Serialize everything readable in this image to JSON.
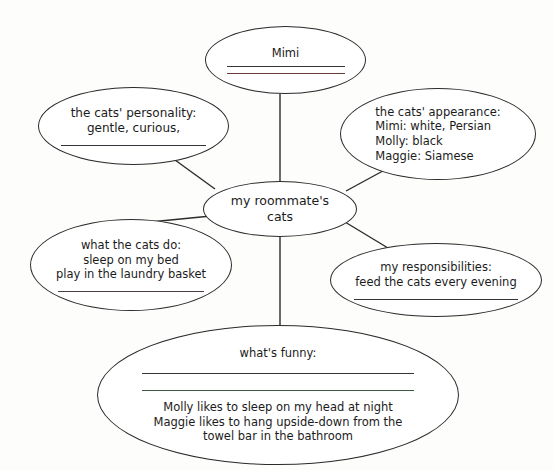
{
  "diagram": {
    "type": "cluster-web-organizer",
    "center": {
      "name": "center-topic",
      "lines": [
        "my roommate's",
        "cats"
      ]
    },
    "nodes": [
      {
        "name": "mimi",
        "lines": [
          "Mimi"
        ],
        "rules": [
          "dark",
          "red"
        ]
      },
      {
        "name": "personality",
        "lines": [
          "the cats' personality:",
          "gentle, curious,"
        ],
        "rules": [
          "dark"
        ]
      },
      {
        "name": "appearance",
        "lines": [
          "the cats' appearance:",
          "Mimi:  white, Persian",
          "Molly:  black",
          "Maggie:  Siamese"
        ],
        "rules": []
      },
      {
        "name": "what-the-cats-do",
        "lines": [
          "what the cats do:",
          "sleep on my bed",
          "play in the laundry basket"
        ],
        "rules": [
          "mixed"
        ]
      },
      {
        "name": "responsibilities",
        "lines": [
          "my responsibilities:",
          "feed the cats every evening"
        ],
        "rules": [
          "dark"
        ]
      },
      {
        "name": "whats-funny",
        "heading": "what's funny:",
        "rules": [
          "dark",
          "green"
        ],
        "lines": [
          "Molly likes to sleep on my head at night",
          "Maggie likes to hang upside-down from the",
          "towel bar in the bathroom"
        ]
      }
    ],
    "colors": {
      "ink": "#1b1b1b",
      "outline": "#2b2b2b",
      "rule_dark": "#33333a",
      "rule_red": "#6b3a38",
      "rule_green": "#3b5a47",
      "background": "#fdfdfc"
    }
  }
}
